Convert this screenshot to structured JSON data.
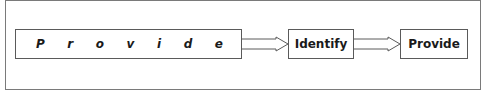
{
  "diagram": {
    "type": "flow",
    "steps": [
      {
        "label": "Provide",
        "letters": [
          "P",
          "r",
          "o",
          "v",
          "i",
          "d",
          "e"
        ],
        "style": "letter-spaced italic"
      },
      {
        "label": "Identify"
      },
      {
        "label": "Provide"
      }
    ],
    "connectors": [
      {
        "from": 0,
        "to": 1,
        "style": "hollow-double-line-arrow"
      },
      {
        "from": 1,
        "to": 2,
        "style": "hollow-double-line-arrow"
      }
    ],
    "colors": {
      "border": "#5a5a5a",
      "frame": "#7a7a7a",
      "text": "#1a1a1a",
      "background": "#ffffff"
    }
  }
}
